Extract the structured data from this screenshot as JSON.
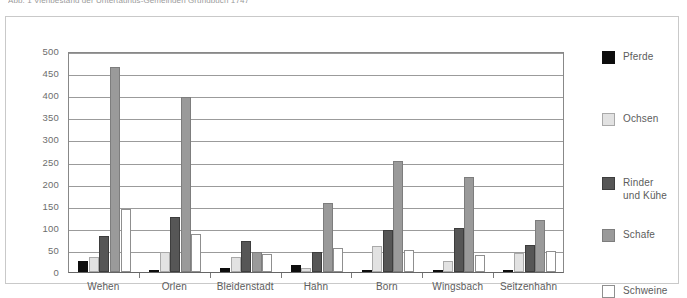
{
  "caption": "Abb. 1   Viehbestand der Untertaunus-Gemeinden Grundbuch 1747",
  "chart_data": {
    "type": "bar",
    "title": "",
    "xlabel": "",
    "ylabel": "",
    "ylim": [
      0,
      500
    ],
    "ytick_step": 50,
    "yticks": [
      "500",
      "450",
      "400",
      "350",
      "300",
      "250",
      "200",
      "150",
      "100",
      "50",
      "0"
    ],
    "grid": true,
    "legend_position": "right",
    "categories": [
      "Wehen",
      "Orlen",
      "Bleidenstadt",
      "Hahn",
      "Born",
      "Wingsbach",
      "Seitzenhahn"
    ],
    "series": [
      {
        "name": "Pferde",
        "color": "#0d0d0d",
        "values": [
          25,
          2,
          10,
          15,
          5,
          3,
          3
        ]
      },
      {
        "name": "Ochsen",
        "color": "#e2e2e2",
        "values": [
          33,
          45,
          35,
          8,
          58,
          25,
          43
        ]
      },
      {
        "name": "Rinder\nund Kühe",
        "color": "#565656",
        "values": [
          82,
          125,
          70,
          45,
          95,
          100,
          60
        ]
      },
      {
        "name": "Schafe",
        "color": "#9a9a9a",
        "values": [
          463,
          395,
          45,
          157,
          252,
          215,
          118
        ]
      },
      {
        "name": "Schweine",
        "color": "#ffffff",
        "values": [
          142,
          85,
          40,
          55,
          50,
          38,
          48
        ]
      }
    ]
  },
  "legend": {
    "items": [
      {
        "label": "Pferde"
      },
      {
        "label": "Ochsen"
      },
      {
        "label": "Rinder\nund Kühe"
      },
      {
        "label": "Schafe"
      },
      {
        "label": "Schweine"
      }
    ]
  }
}
